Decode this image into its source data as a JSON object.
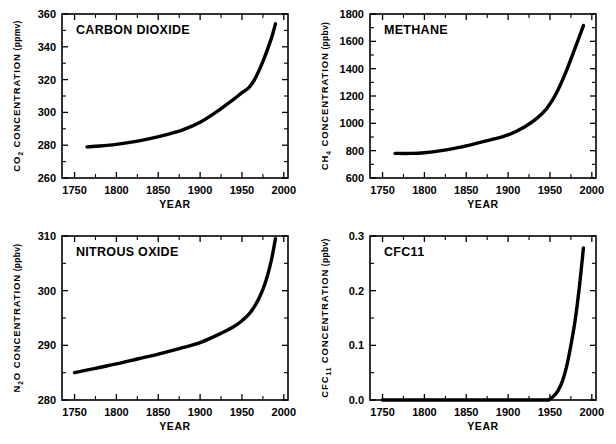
{
  "figure": {
    "name": "greenhouse-gas-concentrations-figure",
    "background_color": "#ffffff",
    "line_color": "#000000",
    "panel_count": 4
  },
  "chart_data": [
    {
      "id": "co2",
      "type": "line",
      "title": "CARBON DIOXIDE",
      "xlabel": "YEAR",
      "ylabel": "CO2 CONCENTRATION (ppmv)",
      "ylabel_species": "CO",
      "ylabel_subscript": "2",
      "ylabel_rest": "CONCENTRATION",
      "ylabel_units": "(ppmv)",
      "xlim": [
        1735,
        2005
      ],
      "ylim": [
        260,
        360
      ],
      "xticks": [
        1750,
        1800,
        1850,
        1900,
        1950,
        2000
      ],
      "yticks": [
        260,
        280,
        300,
        320,
        340,
        360
      ],
      "y_minor_step": 10,
      "x_minor_step": 25,
      "grid": false,
      "legend": false,
      "x": [
        1765,
        1780,
        1800,
        1820,
        1840,
        1860,
        1880,
        1900,
        1920,
        1940,
        1950,
        1958,
        1965,
        1975,
        1985,
        1990
      ],
      "values": [
        279,
        279.5,
        280.5,
        282,
        284,
        286.5,
        289.5,
        294,
        300.5,
        308,
        312,
        315,
        320,
        331,
        345,
        354
      ]
    },
    {
      "id": "ch4",
      "type": "line",
      "title": "METHANE",
      "xlabel": "YEAR",
      "ylabel": "CH4 CONCENTRATION (ppbv)",
      "ylabel_species": "CH",
      "ylabel_subscript": "4",
      "ylabel_rest": "CONCENTRATION",
      "ylabel_units": "(ppbv)",
      "xlim": [
        1735,
        2005
      ],
      "ylim": [
        600,
        1800
      ],
      "xticks": [
        1750,
        1800,
        1850,
        1900,
        1950,
        2000
      ],
      "yticks": [
        600,
        800,
        1000,
        1200,
        1400,
        1600,
        1800
      ],
      "y_minor_step": 100,
      "x_minor_step": 25,
      "grid": false,
      "legend": false,
      "x": [
        1765,
        1785,
        1800,
        1820,
        1840,
        1860,
        1880,
        1900,
        1920,
        1935,
        1945,
        1952,
        1960,
        1970,
        1980,
        1990
      ],
      "values": [
        780,
        780,
        785,
        800,
        822,
        850,
        880,
        915,
        975,
        1040,
        1100,
        1160,
        1250,
        1390,
        1550,
        1715
      ]
    },
    {
      "id": "n2o",
      "type": "line",
      "title": "NITROUS OXIDE",
      "xlabel": "YEAR",
      "ylabel": "N2O CONCENTRATION (ppbv)",
      "ylabel_species": "N",
      "ylabel_subscript": "2",
      "ylabel_species_tail": "O",
      "ylabel_rest": "CONCENTRATION",
      "ylabel_units": "(ppbv)",
      "xlim": [
        1735,
        2005
      ],
      "ylim": [
        280,
        310
      ],
      "xticks": [
        1750,
        1800,
        1850,
        1900,
        1950,
        2000
      ],
      "yticks": [
        280,
        290,
        300,
        310
      ],
      "y_minor_step": 5,
      "x_minor_step": 25,
      "grid": false,
      "legend": false,
      "x": [
        1750,
        1775,
        1800,
        1825,
        1850,
        1875,
        1900,
        1925,
        1940,
        1950,
        1960,
        1970,
        1978,
        1985,
        1990
      ],
      "values": [
        285,
        285.8,
        286.6,
        287.5,
        288.4,
        289.4,
        290.5,
        292.2,
        293.4,
        294.5,
        296,
        298.5,
        301.5,
        305.5,
        309.5
      ]
    },
    {
      "id": "cfc11",
      "type": "line",
      "title": "CFC11",
      "xlabel": "YEAR",
      "ylabel": "CFC11 CONCENTRATION (ppbv)",
      "ylabel_species": "CFC",
      "ylabel_subscript": "11",
      "ylabel_rest": "CONCENTRATION",
      "ylabel_units": "(ppbv)",
      "xlim": [
        1735,
        2005
      ],
      "ylim": [
        0.0,
        0.3
      ],
      "xticks": [
        1750,
        1800,
        1850,
        1900,
        1950,
        2000
      ],
      "yticks": [
        "0.0",
        "0.1",
        "0.2",
        "0.3"
      ],
      "ytick_values": [
        0.0,
        0.1,
        0.2,
        0.3
      ],
      "y_minor_step": 0.05,
      "x_minor_step": 25,
      "grid": false,
      "legend": false,
      "x": [
        1750,
        1930,
        1945,
        1950,
        1955,
        1960,
        1965,
        1970,
        1975,
        1980,
        1985,
        1990
      ],
      "values": [
        0.0,
        0.0,
        0.0,
        0.002,
        0.008,
        0.018,
        0.035,
        0.062,
        0.1,
        0.145,
        0.205,
        0.278
      ]
    }
  ]
}
